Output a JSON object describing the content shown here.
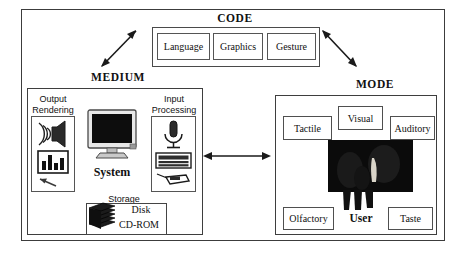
{
  "diagram": {
    "title_sections": [
      "CODE",
      "MEDIUM",
      "MODE"
    ],
    "colors": {
      "frame": "#3c3c3c",
      "box_border": "#4f4f4f",
      "text": "#111111",
      "photo_fill": "#0b0b0b",
      "background": "#ffffff"
    }
  },
  "code": {
    "heading": "CODE",
    "items": [
      {
        "label": "Language"
      },
      {
        "label": "Graphics"
      },
      {
        "label": "Gesture"
      }
    ]
  },
  "medium": {
    "heading": "MEDIUM",
    "output": {
      "label": "Output\nRendering",
      "label_line1": "Output",
      "label_line2": "Rendering",
      "icons": [
        "speaker-icon",
        "bar-chart-icon",
        "cursor-arrow-icon"
      ]
    },
    "input": {
      "label_line1": "Input",
      "label_line2": "Processing",
      "icons": [
        "microphone-icon",
        "keyboard-icon",
        "mouse-icon"
      ]
    },
    "system": {
      "label": "System",
      "icon": "monitor-icon"
    },
    "storage": {
      "label": "Storage",
      "icon": "disk-stack-icon",
      "media": [
        "Disk",
        "CD-ROM"
      ]
    }
  },
  "mode": {
    "heading": "MODE",
    "items": [
      {
        "label": "Tactile"
      },
      {
        "label": "Visual"
      },
      {
        "label": "Auditory"
      },
      {
        "label": "Olfactory"
      },
      {
        "label": "Taste"
      }
    ],
    "user": {
      "label": "User",
      "photo": "user-photograph"
    }
  },
  "connectors": [
    {
      "name": "medium-code",
      "style": "double-headed-diagonal-up-right"
    },
    {
      "name": "code-mode",
      "style": "double-headed-diagonal-down-right"
    },
    {
      "name": "medium-mode",
      "style": "double-headed-horizontal"
    }
  ]
}
